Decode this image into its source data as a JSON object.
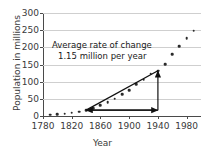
{
  "chart_data": {
    "type": "scatter",
    "title": "",
    "xlabel": "Year",
    "ylabel": "Population in millions",
    "xlim": [
      1780,
      2000
    ],
    "ylim": [
      0,
      300
    ],
    "xticks": [
      1780,
      1820,
      1860,
      1900,
      1940,
      1980
    ],
    "yticks": [
      0,
      50,
      100,
      150,
      200,
      250,
      300
    ],
    "grid": "horizontal",
    "legend": "none",
    "x": [
      1790,
      1800,
      1810,
      1820,
      1830,
      1840,
      1850,
      1860,
      1870,
      1880,
      1890,
      1900,
      1910,
      1920,
      1930,
      1940,
      1950,
      1960,
      1970,
      1980,
      1990
    ],
    "values": [
      3.9,
      5.3,
      7.2,
      9.6,
      12.9,
      17.1,
      23.2,
      31.4,
      39.8,
      50.2,
      62.9,
      76.0,
      92.0,
      105.7,
      122.8,
      131.7,
      151.3,
      179.3,
      203.3,
      226.5,
      248.7
    ],
    "annotations": [
      {
        "name": "average-rate-of-change",
        "line1": "Average rate of change",
        "line2": "1.15 million per year",
        "secant_from": [
          1840,
          17.1
        ],
        "secant_to": [
          1940,
          131.7
        ],
        "run_arrow": {
          "from": [
            1840,
            17.1
          ],
          "to": [
            1940,
            17.1
          ],
          "double_headed": true
        },
        "rise_arrow": {
          "from": [
            1940,
            17.1
          ],
          "to": [
            1940,
            131.7
          ]
        }
      }
    ],
    "colors": {
      "marker": "#2b2b2b",
      "grid": "#cfcfcf",
      "axis": "#4a4a4a",
      "annotation": "#1a1a1a",
      "background": "#ffffff"
    }
  }
}
